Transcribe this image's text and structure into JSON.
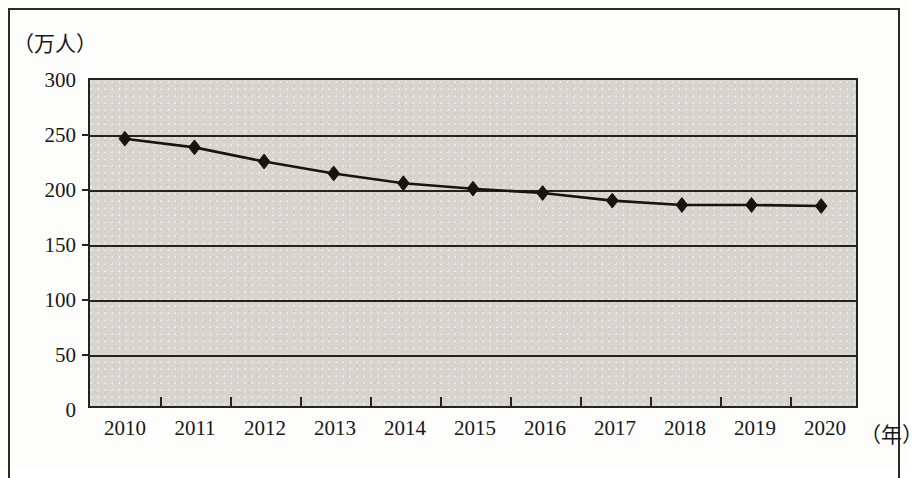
{
  "figure": {
    "y_unit_caption": "（万人）",
    "x_unit_caption": "（年）"
  },
  "chart_data": {
    "type": "line",
    "title": "",
    "subtitle": "",
    "xlabel": "（年）",
    "ylabel": "（万人）",
    "categories": [
      "2010",
      "2011",
      "2012",
      "2013",
      "2014",
      "2015",
      "2016",
      "2017",
      "2018",
      "2019",
      "2020"
    ],
    "values": [
      246,
      238,
      225,
      214,
      205,
      200,
      196,
      189,
      185,
      185,
      184
    ],
    "series": [
      {
        "name": "",
        "values": [
          246,
          238,
          225,
          214,
          205,
          200,
          196,
          189,
          185,
          185,
          184
        ]
      }
    ],
    "ylim": [
      0,
      300
    ],
    "yticks": [
      0,
      50,
      100,
      150,
      200,
      250,
      300
    ],
    "ytick_labels": [
      "0",
      "50",
      "100",
      "150",
      "200",
      "250",
      "300"
    ],
    "xtick_labels": [
      "2010",
      "2011",
      "2012",
      "2013",
      "2014",
      "2015",
      "2016",
      "2017",
      "2018",
      "2019",
      "2020"
    ],
    "grid": true,
    "grid_axis": "y",
    "legend": false,
    "legend_position": "none",
    "marker": "diamond",
    "plot_background_color": "#d6d5d0",
    "line_color": "#17150f",
    "marker_color": "#17150f",
    "axis_color": "#23231f",
    "annotations": []
  }
}
